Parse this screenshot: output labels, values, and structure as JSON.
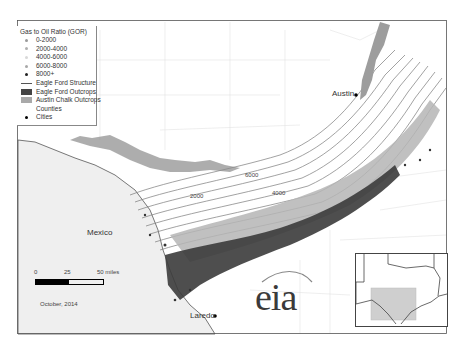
{
  "legend": {
    "title": "Gas to Oil Ratio (GOR)",
    "items": [
      {
        "label": "0-2000",
        "type": "dot",
        "color": "#9a9a9a"
      },
      {
        "label": "2000-4000",
        "type": "dot",
        "color": "#b0b0b0"
      },
      {
        "label": "4000-6000",
        "type": "dot",
        "color": "#d8d8d8"
      },
      {
        "label": "6000-8000",
        "type": "dot",
        "color": "#a8a8a8"
      },
      {
        "label": "8000+",
        "type": "dot",
        "color": "#222222"
      },
      {
        "label": "Eagle Ford Structure",
        "type": "line",
        "color": "#555555"
      },
      {
        "label": "Eagle Ford Outcrops",
        "type": "box",
        "color": "#444444"
      },
      {
        "label": "Austin Chalk Outcrops",
        "type": "box",
        "color": "#a9a9a9"
      },
      {
        "label": "Counties",
        "type": "none",
        "color": "#ffffff"
      },
      {
        "label": "Cities",
        "type": "dot",
        "color": "#000000"
      }
    ]
  },
  "map": {
    "cities": [
      {
        "name": "Austin"
      },
      {
        "name": "Laredo"
      }
    ],
    "country_label": "Mexico",
    "contour_labels": [
      "2000",
      "4000",
      "6000"
    ],
    "scale_bar": {
      "ticks": [
        "0",
        "25",
        "50 miles"
      ]
    },
    "date": "October, 2014",
    "logo": "eia"
  },
  "colors": {
    "background": "#ffffff",
    "mexico_fill": "#efefef",
    "contour": "#777777",
    "county_line": "#dddddd"
  }
}
